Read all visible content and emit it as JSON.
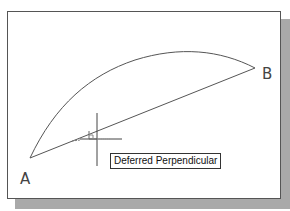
{
  "drawing": {
    "points": [
      {
        "name": "A",
        "label": "A",
        "x": 30,
        "y": 158
      },
      {
        "name": "B",
        "label": "B",
        "x": 255,
        "y": 68
      }
    ],
    "arc": {
      "from": "A",
      "to": "B",
      "control": [
        120,
        20
      ]
    },
    "line": {
      "from": "A",
      "to": "B"
    },
    "cursor": {
      "x": 97,
      "y": 139
    },
    "snap_marker": "perpendicular-marker"
  },
  "tooltip": {
    "text": "Deferred Perpendicular"
  },
  "colors": {
    "line": "#555555",
    "frame": "#555555",
    "shadow": "#a9a9a9",
    "background": "#ffffff"
  }
}
